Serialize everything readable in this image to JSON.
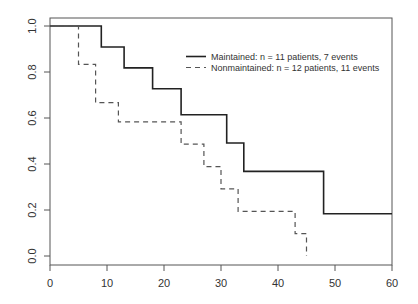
{
  "chart_data": {
    "type": "line",
    "subtype": "kaplan-meier-step",
    "title": "",
    "xlabel": "",
    "ylabel": "",
    "xlim": [
      0,
      60
    ],
    "ylim": [
      0,
      1.0
    ],
    "x_ticks": [
      "0",
      "10",
      "20",
      "30",
      "40",
      "50",
      "60"
    ],
    "y_ticks": [
      "0.0",
      "0.2",
      "0.4",
      "0.6",
      "0.8",
      "1.0"
    ],
    "grid": false,
    "legend_position": "top-right",
    "series": [
      {
        "name": "Maintained: n = 11 patients, 7 events",
        "style": "solid",
        "color": "#222222",
        "x": [
          0,
          9,
          13,
          18,
          23,
          31,
          34,
          48,
          60
        ],
        "y": [
          1.0,
          0.909,
          0.818,
          0.727,
          0.614,
          0.491,
          0.368,
          0.184,
          0.184
        ]
      },
      {
        "name": "Nonmaintained: n = 12 patients, 11 events",
        "style": "dashed",
        "color": "#555555",
        "x": [
          0,
          5,
          8,
          12,
          23,
          27,
          30,
          33,
          43,
          45
        ],
        "y": [
          1.0,
          0.833,
          0.667,
          0.583,
          0.486,
          0.389,
          0.292,
          0.194,
          0.097,
          0.0
        ]
      }
    ]
  }
}
